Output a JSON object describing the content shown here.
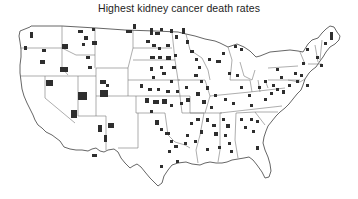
{
  "map": {
    "title": "Highest kidney cancer death rates",
    "region": "Contiguous United States",
    "legend": "Dark shaded counties: highest kidney cancer death rates",
    "highlight_color": "#2e2e2e",
    "border_color": "#777777",
    "states_with_notable_clusters": [
      "Nevada",
      "Utah",
      "Arizona",
      "New Mexico",
      "Nebraska",
      "South Dakota",
      "North Dakota",
      "Kansas",
      "Oklahoma",
      "Texas",
      "Iowa",
      "Missouri",
      "Georgia",
      "Mississippi",
      "Alabama",
      "Maine",
      "Michigan"
    ]
  }
}
